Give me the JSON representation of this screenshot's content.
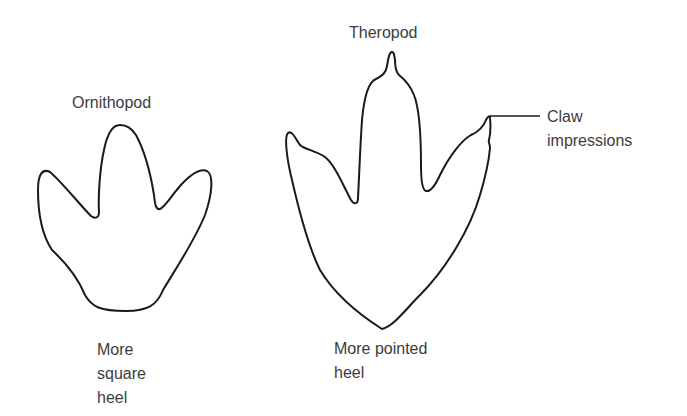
{
  "diagram": {
    "stroke_color": "#1a1a1a",
    "text_color": "#3c3c3c",
    "footprints": [
      {
        "name": "Ornithopod",
        "label": "Ornithopod",
        "heel_caption": "More\nsquare\nheel"
      },
      {
        "name": "Theropod",
        "label": "Theropod",
        "heel_caption": "More pointed\nheel"
      }
    ],
    "annotations": [
      {
        "label": "Claw\nimpressions",
        "points_to": "Theropod claw tips"
      }
    ]
  }
}
